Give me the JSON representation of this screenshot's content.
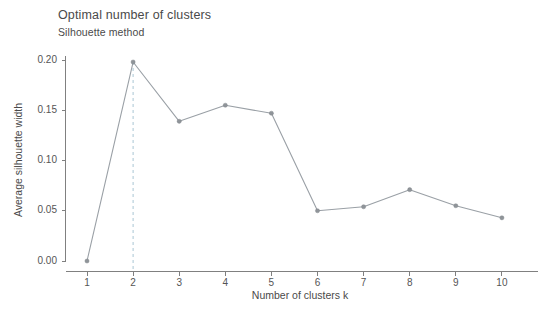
{
  "chart_data": {
    "type": "line",
    "title": "Optimal number of clusters",
    "subtitle": "Silhouette method",
    "xlabel": "Number of clusters k",
    "ylabel": "Average silhouette width",
    "categories": [
      1,
      2,
      3,
      4,
      5,
      6,
      7,
      8,
      9,
      10
    ],
    "x": [
      1,
      2,
      3,
      4,
      5,
      6,
      7,
      8,
      9,
      10
    ],
    "values": [
      0.0,
      0.198,
      0.139,
      0.155,
      0.147,
      0.05,
      0.054,
      0.071,
      0.055,
      0.043
    ],
    "series": [
      {
        "name": "Average silhouette width",
        "values": [
          0.0,
          0.198,
          0.139,
          0.155,
          0.147,
          0.05,
          0.054,
          0.071,
          0.055,
          0.043
        ]
      }
    ],
    "xtick_labels": [
      "1",
      "2",
      "3",
      "4",
      "5",
      "6",
      "7",
      "8",
      "9",
      "10"
    ],
    "ytick_labels": [
      "0.00",
      "0.05",
      "0.10",
      "0.15",
      "0.20"
    ],
    "ytick_values": [
      0.0,
      0.05,
      0.1,
      0.15,
      0.2
    ],
    "ylim": [
      -0.004,
      0.206
    ],
    "xlim": [
      0.55,
      10.6
    ],
    "grid": false,
    "legend": false,
    "annotations": [
      {
        "name": "optimal-k-dashed-line",
        "type": "vertical-dashed-line",
        "x": 2,
        "label": "",
        "color": "#a9c6d4"
      }
    ],
    "colors": {
      "line": "#9aa0a6",
      "point": "#8f9499",
      "axis": "#808080",
      "text": "#4a4a4a",
      "optimal_line": "#a9c6d4",
      "background": "#ffffff"
    }
  }
}
